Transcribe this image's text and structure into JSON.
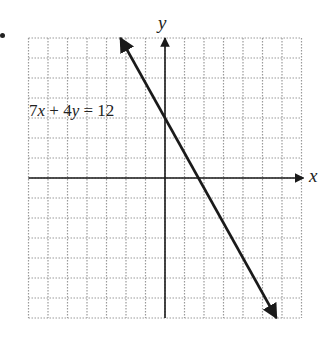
{
  "chart_data": {
    "type": "line",
    "title": "",
    "xlabel": "x",
    "ylabel": "y",
    "xlim": [
      -7,
      7
    ],
    "ylim": [
      -7,
      7
    ],
    "grid": true,
    "grid_style": "dotted",
    "grid_step": 1,
    "tick_labels": false,
    "series": [
      {
        "name": "7x + 4y = 12",
        "equation": "7x + 4y = 12",
        "slope": -1.75,
        "y_intercept": 3,
        "x_intercept": 1.714,
        "x": [
          -2.286,
          5.714
        ],
        "y": [
          7,
          -7
        ],
        "arrows": "both"
      }
    ],
    "annotations": [
      {
        "text": "7x + 4y = 12",
        "x": -6.8,
        "y": 3
      }
    ]
  },
  "labels": {
    "equation_prefix_num1": "7",
    "equation_var1": "x",
    "equation_plus": " + 4",
    "equation_var2": "y",
    "equation_rhs": " = 12",
    "x_axis": "x",
    "y_axis": "y"
  },
  "style": {
    "line_color": "#1a1a1a",
    "axis_color": "#1a1a1a",
    "grid_color": "#9a9a9a",
    "background": "#ffffff"
  },
  "geometry": {
    "origin_px": [
      165,
      178
    ],
    "unit_px_x": 19.5,
    "unit_px_y": 20
  }
}
